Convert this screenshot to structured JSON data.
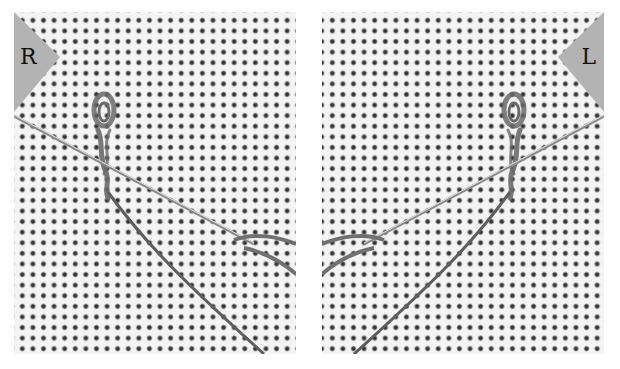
{
  "figure": {
    "panels": [
      {
        "id": "right-hand",
        "label": "R",
        "description": "Needle threaded through stitch from left, right-handed view"
      },
      {
        "id": "left-hand",
        "label": "L",
        "description": "Needle threaded through stitch from right, left-handed mirrored view"
      }
    ],
    "colors": {
      "background": "#ffffff",
      "fabric": "#f4f4f4",
      "fabric_holes": "#333333",
      "label_tab": "#b3b3b3",
      "thread": "#6e6e6e",
      "needle": "#9a9a9a"
    }
  }
}
